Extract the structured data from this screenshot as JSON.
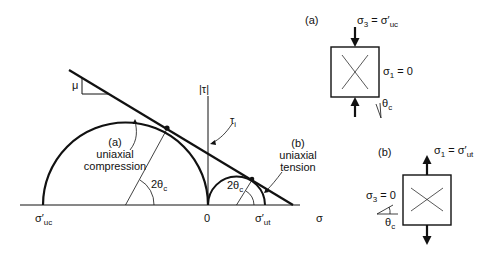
{
  "mohr": {
    "axis_sigma": "σ",
    "axis_tau": "|τ|",
    "origin": "0",
    "sigma_uc_base": "σ′",
    "sigma_uc_sub": "uc",
    "sigma_ut_base": "σ′",
    "sigma_ut_sub": "ut",
    "mu": "μ",
    "tau_i_base": "τ",
    "tau_i_sub": "i",
    "angle_a_base": "2θ",
    "angle_a_sub": "c",
    "angle_b_base": "2θ",
    "angle_b_sub": "c",
    "label_a_tag": "(a)",
    "label_a_line1": "uniaxial",
    "label_a_line2": "compression",
    "label_b_tag": "(b)",
    "label_b_line1": "uniaxial",
    "label_b_line2": "tension"
  },
  "element_a": {
    "tag": "(a)",
    "top_base": "σ",
    "top_sub": "3",
    "top_eq": " = σ′",
    "top_sub2": "uc",
    "side_base": "σ",
    "side_sub": "1",
    "side_eq": " = 0",
    "angle_base": "θ",
    "angle_sub": "c"
  },
  "element_b": {
    "tag": "(b)",
    "top_base": "σ",
    "top_sub": "1",
    "top_eq": " = σ′",
    "top_sub2": "ut",
    "side_base": "σ",
    "side_sub": "3",
    "side_eq": " = 0",
    "angle_base": "θ",
    "angle_sub": "c"
  }
}
